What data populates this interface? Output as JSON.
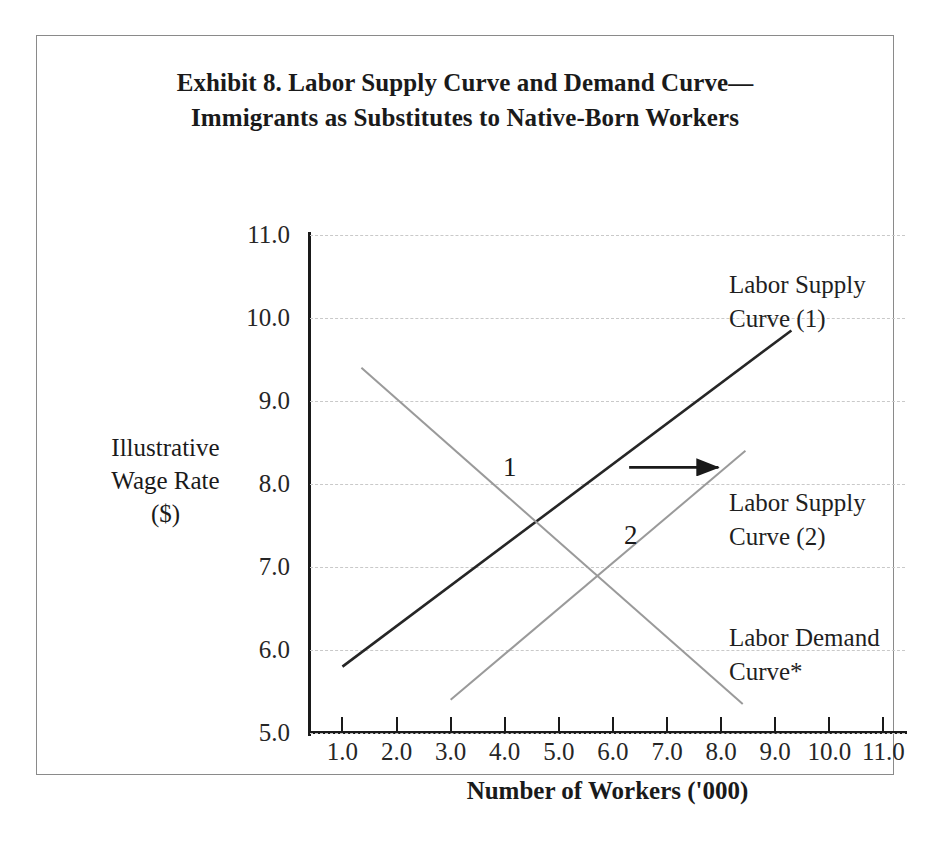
{
  "figure": {
    "title_lines": [
      "Exhibit 8. Labor Supply Curve and Demand Curve—",
      "Immigrants as Substitutes to Native-Born Workers"
    ]
  },
  "chart_data": {
    "type": "line",
    "xlabel": "Number of Workers ('000)",
    "ylabel_lines": [
      "Illustrative",
      "Wage Rate",
      "($)"
    ],
    "ylabel": "Illustrative Wage Rate ($)",
    "xlim": [
      0.4,
      11.4
    ],
    "ylim": [
      5.0,
      11.0
    ],
    "xticks": [
      "1.0",
      "2.0",
      "3.0",
      "4.0",
      "5.0",
      "6.0",
      "7.0",
      "8.0",
      "9.0",
      "10.0",
      "11.0"
    ],
    "xtick_values": [
      1.0,
      2.0,
      3.0,
      4.0,
      5.0,
      6.0,
      7.0,
      8.0,
      9.0,
      10.0,
      11.0
    ],
    "yticks": [
      "5.0",
      "6.0",
      "7.0",
      "8.0",
      "9.0",
      "10.0",
      "11.0"
    ],
    "ytick_values": [
      5.0,
      6.0,
      7.0,
      8.0,
      9.0,
      10.0,
      11.0
    ],
    "grid": "horizontal-dashed",
    "legend": "none",
    "series": [
      {
        "name": "Labor Supply Curve (1)",
        "color": "#262626",
        "x": [
          1.0,
          9.3
        ],
        "y": [
          5.8,
          9.85
        ]
      },
      {
        "name": "Labor Supply Curve (2)",
        "color": "#9a9a9a",
        "x": [
          3.0,
          8.45
        ],
        "y": [
          5.4,
          8.4
        ]
      },
      {
        "name": "Labor Demand Curve*",
        "color": "#9a9a9a",
        "x": [
          1.35,
          8.4
        ],
        "y": [
          9.4,
          5.35
        ]
      }
    ],
    "annotations": [
      {
        "id": "supply-1",
        "text_lines": [
          "Labor Supply",
          "Curve (1)"
        ],
        "x": 9.0,
        "y": 10.35
      },
      {
        "id": "supply-2",
        "text_lines": [
          "Labor Supply",
          "Curve (2)"
        ],
        "x": 9.0,
        "y": 7.75
      },
      {
        "id": "demand",
        "text_lines": [
          "Labor Demand",
          "Curve*"
        ],
        "x": 9.0,
        "y": 6.15
      },
      {
        "id": "equilibrium-1",
        "text": "1",
        "x": 4.45,
        "y": 8.15
      },
      {
        "id": "equilibrium-2",
        "text": "2",
        "x": 5.85,
        "y": 7.1
      }
    ],
    "shift_arrow": {
      "direction": "right",
      "x_start": 6.3,
      "x_end": 7.95,
      "y": 8.2
    }
  }
}
